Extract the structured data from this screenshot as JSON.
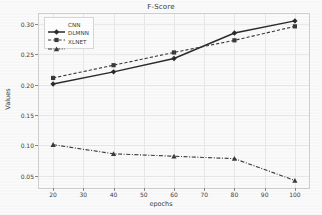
{
  "chart_data": {
    "type": "line",
    "title": "F-Score",
    "xlabel": "epochs",
    "ylabel": "Values",
    "x": [
      20,
      40,
      60,
      80,
      100
    ],
    "xlim": [
      15,
      105
    ],
    "ylim": [
      0.028,
      0.318
    ],
    "xticks": [
      20,
      30,
      40,
      50,
      60,
      70,
      80,
      90,
      100
    ],
    "xtick_labels": [
      "20",
      "30",
      "40",
      "50",
      "60",
      "70",
      "80",
      "90",
      "100"
    ],
    "yticks": [
      0.05,
      0.1,
      0.15,
      0.2,
      0.25,
      0.3
    ],
    "ytick_labels": [
      "0.05",
      "0.10",
      "0.15",
      "0.20",
      "0.25",
      "0.30"
    ],
    "grid": true,
    "legend_position": "upper left",
    "series": [
      {
        "name": "CNN",
        "values": [
          0.201,
          0.221,
          0.243,
          0.285,
          0.305
        ],
        "color": "#2b2b2b",
        "linestyle": "solid",
        "marker": "diamond"
      },
      {
        "name": "DLMNN",
        "values": [
          0.211,
          0.232,
          0.253,
          0.273,
          0.296
        ],
        "color": "#3a3a3a",
        "linestyle": "dashed",
        "marker": "square"
      },
      {
        "name": "XLNET",
        "values": [
          0.101,
          0.086,
          0.082,
          0.078,
          0.042
        ],
        "color": "#3a3a3a",
        "linestyle": "dashdot",
        "marker": "triangle"
      }
    ]
  },
  "legend": {
    "items": [
      {
        "label": "CNN"
      },
      {
        "label": "DLMNN"
      },
      {
        "label": "XLNET"
      }
    ]
  }
}
